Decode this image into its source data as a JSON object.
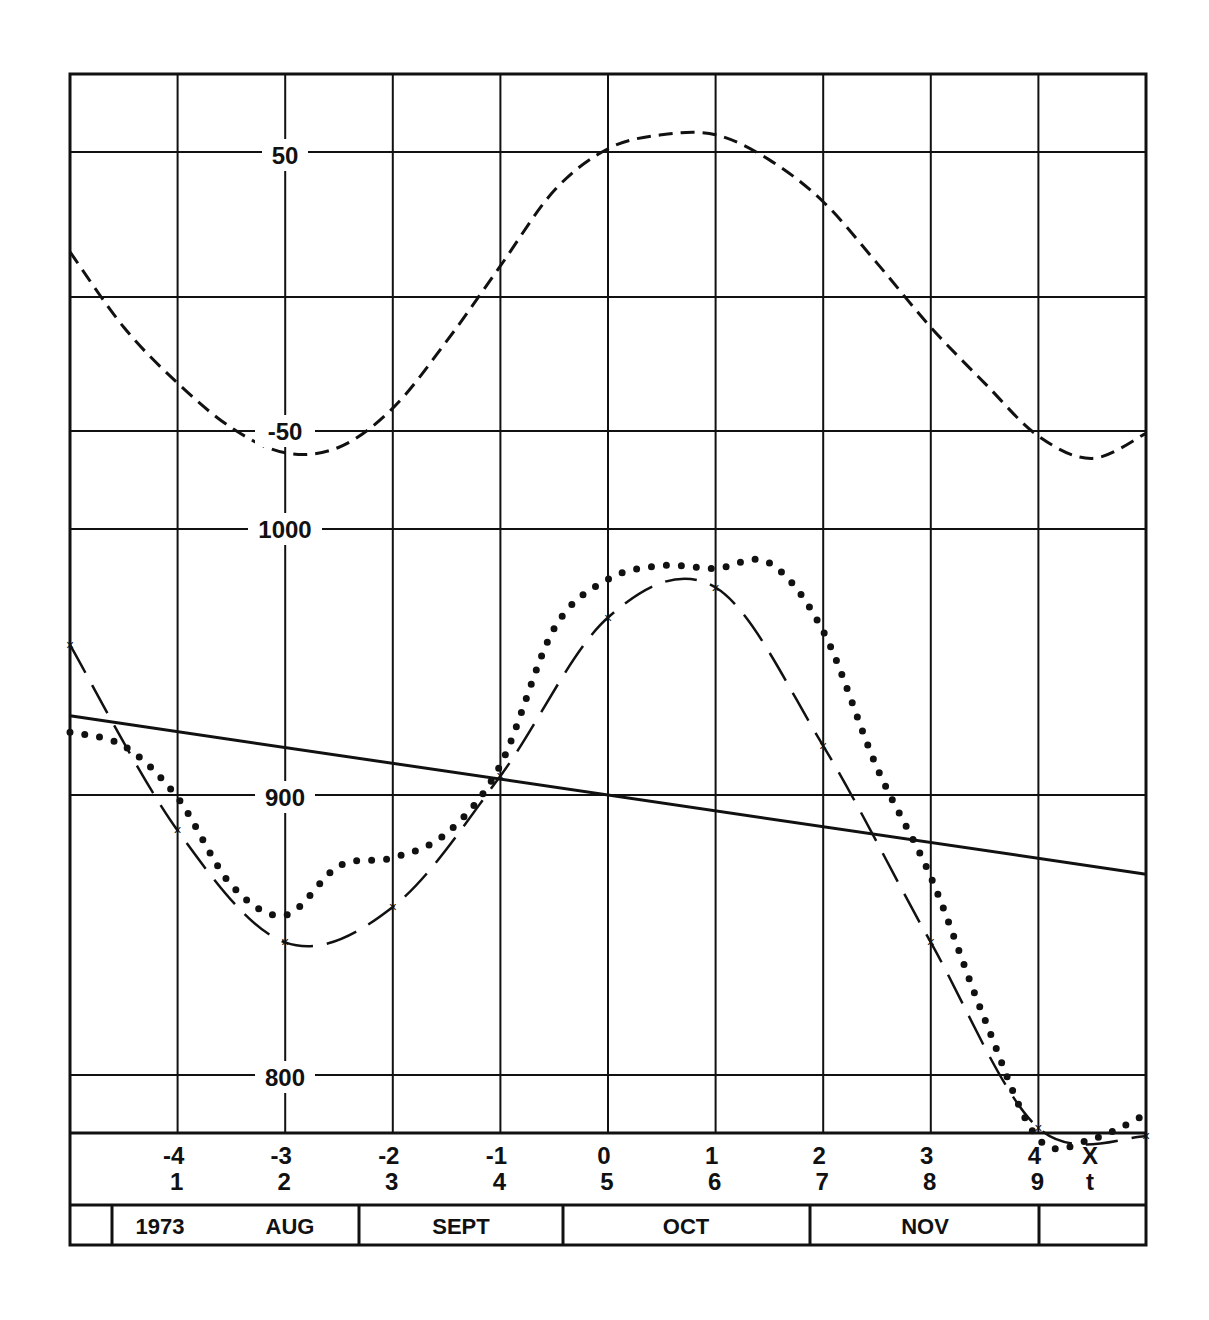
{
  "chart_data": [
    {
      "type": "line",
      "panel": "upper",
      "title": "",
      "xlabel": "X",
      "ylabel": "",
      "y_ticks": [
        50,
        -50
      ],
      "ylim": [
        -65,
        85
      ],
      "grid": true,
      "series": [
        {
          "name": "short-dashed oscillation",
          "style": "short-dash",
          "x": [
            -5,
            -4.5,
            -4,
            -3.5,
            -3,
            -2.5,
            -2,
            -1.5,
            -1,
            -0.5,
            0,
            0.5,
            1,
            1.5,
            2,
            2.5,
            3,
            3.5,
            4,
            4.5,
            5
          ],
          "values": [
            14,
            -13,
            -33,
            -49,
            -58,
            -56,
            -42,
            -18,
            9,
            36,
            51,
            56,
            56,
            47,
            32,
            10,
            -13,
            -33,
            -52,
            -60,
            -51
          ]
        }
      ]
    },
    {
      "type": "line",
      "panel": "lower",
      "title": "",
      "xlabel": "X / t",
      "ylabel": "",
      "y_ticks": [
        1000,
        900,
        800
      ],
      "ylim": [
        777,
        1087
      ],
      "grid": true,
      "x_ticks_X": [
        -4,
        -3,
        -2,
        -1,
        0,
        1,
        2,
        3,
        4
      ],
      "x_ticks_t": [
        1,
        2,
        3,
        4,
        5,
        6,
        7,
        8,
        9
      ],
      "series": [
        {
          "name": "linear trend",
          "style": "solid",
          "x": [
            -5,
            5
          ],
          "values": [
            929,
            871
          ]
        },
        {
          "name": "fitted curve (x markers)",
          "style": "long-dash",
          "markers": "x",
          "x": [
            -5,
            -4,
            -3,
            -2,
            -1,
            0,
            1,
            2,
            3,
            4,
            5
          ],
          "values": [
            955,
            887,
            846,
            859,
            907,
            965,
            976,
            918,
            846,
            778,
            775
          ]
        },
        {
          "name": "observed (dotted)",
          "style": "dotted",
          "x": [
            -5,
            -4.5,
            -4,
            -3.5,
            -3,
            -2.5,
            -2,
            -1.5,
            -1,
            -0.5,
            0,
            0.5,
            1,
            1.5,
            2,
            2.5,
            3,
            3.5,
            4,
            4.5,
            5
          ],
          "values": [
            923,
            918,
            899,
            867,
            856,
            874,
            877,
            886,
            911,
            961,
            979,
            984,
            983,
            985,
            960,
            910,
            870,
            818,
            774,
            774,
            783
          ]
        }
      ]
    }
  ],
  "axis": {
    "y_upper_labels": [
      "50",
      "-50"
    ],
    "y_lower_labels": [
      "1000",
      "900",
      "800"
    ],
    "x_row_labels": [
      "-4",
      "-3",
      "-2",
      "-1",
      "0",
      "1",
      "2",
      "3",
      "4"
    ],
    "t_row_labels": [
      "1",
      "2",
      "3",
      "4",
      "5",
      "6",
      "7",
      "8",
      "9"
    ],
    "x_var_label": "X",
    "t_var_label": "t"
  },
  "months": {
    "year": "1973",
    "labels": [
      "AUG",
      "SEPT",
      "OCT",
      "NOV"
    ]
  }
}
